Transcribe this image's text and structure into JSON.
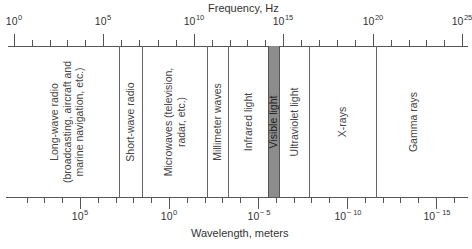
{
  "diagram": {
    "title_top": "Frequency, Hz",
    "title_bottom": "Wavelength, meters",
    "frequency_axis": {
      "labels": [
        {
          "base": "10",
          "exp": "0",
          "x": 14
        },
        {
          "base": "10",
          "exp": "5",
          "x": 103
        },
        {
          "base": "10",
          "exp": "10",
          "x": 194
        },
        {
          "base": "10",
          "exp": "15",
          "x": 283
        },
        {
          "base": "10",
          "exp": "20",
          "x": 373
        },
        {
          "base": "10",
          "exp": "25",
          "x": 462
        }
      ]
    },
    "wavelength_axis": {
      "labels": [
        {
          "base": "10",
          "exp": "5",
          "x": 80
        },
        {
          "base": "10",
          "exp": "0",
          "x": 169
        },
        {
          "base": "10",
          "exp": "− 5",
          "x": 259
        },
        {
          "base": "10",
          "exp": "− 10",
          "x": 348
        },
        {
          "base": "10",
          "exp": "− 15",
          "x": 437
        }
      ]
    },
    "regions": [
      {
        "label": "Long-wave radio\n(broadcasting, aircraft and\nmarine navigation, etc.)",
        "x": 67
      },
      {
        "label": "Short-wave radio",
        "x": 130
      },
      {
        "label": "Microwaves (television,\nradar, etc.)",
        "x": 174
      },
      {
        "label": "Millimeter waves",
        "x": 217
      },
      {
        "label": "Infrared light",
        "x": 248
      },
      {
        "label": "Visible light",
        "x": 273
      },
      {
        "label": "Ultraviolet light",
        "x": 294
      },
      {
        "label": "X-rays",
        "x": 342
      },
      {
        "label": "Gamma rays",
        "x": 413
      }
    ],
    "dividers_x": [
      119,
      142,
      207,
      228,
      309,
      376
    ],
    "visible_band": {
      "x1": 268,
      "x2": 280,
      "color": "#8c8c8c"
    }
  },
  "chart_data": {
    "type": "table",
    "top_axis": {
      "label": "Frequency, Hz",
      "ticks": [
        "10^0",
        "10^5",
        "10^10",
        "10^15",
        "10^20",
        "10^25"
      ],
      "scale": "log"
    },
    "bottom_axis": {
      "label": "Wavelength, meters",
      "ticks": [
        "10^5",
        "10^0",
        "10^-5",
        "10^-10",
        "10^-15"
      ],
      "scale": "log"
    },
    "bands": [
      {
        "name": "Long-wave radio (broadcasting, aircraft and marine navigation, etc.)",
        "freq_log_range": [
          0,
          6.0
        ]
      },
      {
        "name": "Short-wave radio",
        "freq_log_range": [
          6.0,
          7.2
        ]
      },
      {
        "name": "Microwaves (television, radar, etc.)",
        "freq_log_range": [
          7.2,
          10.7
        ]
      },
      {
        "name": "Millimeter waves",
        "freq_log_range": [
          10.7,
          11.9
        ]
      },
      {
        "name": "Infrared light",
        "freq_log_range": [
          11.9,
          14.1
        ]
      },
      {
        "name": "Visible light",
        "freq_log_range": [
          14.1,
          14.8
        ]
      },
      {
        "name": "Ultraviolet light",
        "freq_log_range": [
          14.8,
          16.4
        ]
      },
      {
        "name": "X-rays",
        "freq_log_range": [
          16.4,
          20.1
        ]
      },
      {
        "name": "Gamma rays",
        "freq_log_range": [
          20.1,
          25
        ]
      }
    ]
  }
}
